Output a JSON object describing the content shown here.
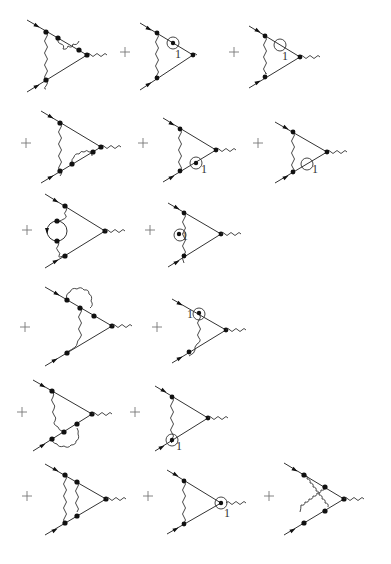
{
  "figure": {
    "title": "",
    "operator_symbol": "+",
    "counterterm_label": "1",
    "rows": [
      {
        "diagrams": [
          {
            "id": "d1",
            "type": "two-loop vertex with vertex correction on upper leg"
          },
          {
            "id": "d2",
            "type": "one-loop vertex with counterterm on upper leg",
            "label": "1"
          },
          {
            "id": "d3",
            "type": "one-loop vertex with mass counterterm on upper leg",
            "label": "1"
          }
        ]
      },
      {
        "diagrams": [
          {
            "id": "d4",
            "type": "two-loop vertex with vertex correction on lower leg"
          },
          {
            "id": "d5",
            "type": "one-loop vertex with counterterm on lower leg",
            "label": "1"
          },
          {
            "id": "d6",
            "type": "one-loop vertex with mass counterterm on lower leg",
            "label": "1"
          }
        ]
      },
      {
        "diagrams": [
          {
            "id": "d7",
            "type": "vacuum polarization insertion"
          },
          {
            "id": "d8",
            "type": "photon propagator counterterm",
            "label": "1"
          }
        ]
      },
      {
        "diagrams": [
          {
            "id": "d9",
            "type": "self-energy on upper external leg"
          },
          {
            "id": "d10",
            "type": "vertex counterterm upper",
            "label": "1"
          }
        ]
      },
      {
        "diagrams": [
          {
            "id": "d11",
            "type": "self-energy on lower external leg"
          },
          {
            "id": "d12",
            "type": "vertex counterterm lower",
            "label": "1"
          }
        ]
      },
      {
        "diagrams": [
          {
            "id": "d13",
            "type": "ladder"
          },
          {
            "id": "d14",
            "type": "vertex counterterm at external vertex",
            "label": "1"
          },
          {
            "id": "d15",
            "type": "crossed ladder"
          }
        ]
      }
    ]
  },
  "labels": {
    "l2": "1",
    "l3": "1",
    "l5": "1",
    "l6": "1",
    "l8": "1",
    "l10": "1",
    "l12": "1",
    "l14": "1"
  },
  "plus": "+"
}
